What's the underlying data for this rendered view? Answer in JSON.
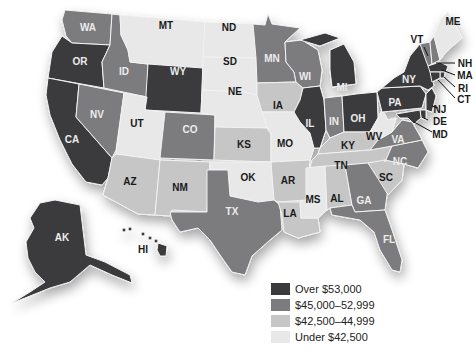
{
  "chart_data": {
    "type": "choropleth",
    "title": "",
    "region": "United States",
    "legend": [
      {
        "key": "c1",
        "label": "Over $53,000",
        "color": "#3b3b3d"
      },
      {
        "key": "c2",
        "label": "$45,000–52,999",
        "color": "#7c7b7e"
      },
      {
        "key": "c3",
        "label": "$42,500–44,999",
        "color": "#c6c6c7"
      },
      {
        "key": "c4",
        "label": "Under $42,500",
        "color": "#e8e8e8"
      }
    ],
    "states": {
      "WA": "c2",
      "OR": "c1",
      "CA": "c1",
      "ID": "c2",
      "NV": "c2",
      "MT": "c4",
      "WY": "c1",
      "UT": "c4",
      "CO": "c2",
      "AZ": "c3",
      "NM": "c3",
      "ND": "c4",
      "SD": "c4",
      "NE": "c4",
      "KS": "c3",
      "OK": "c4",
      "TX": "c2",
      "MN": "c2",
      "IA": "c3",
      "MO": "c4",
      "AR": "c3",
      "LA": "c3",
      "WI": "c2",
      "IL": "c1",
      "MI": "c1",
      "IN": "c2",
      "OH": "c1",
      "KY": "c3",
      "TN": "c3",
      "MS": "c4",
      "AL": "c3",
      "GA": "c2",
      "FL": "c2",
      "SC": "c3",
      "NC": "c2",
      "VA": "c2",
      "WV": "c4",
      "PA": "c1",
      "NY": "c1",
      "VT": "c2",
      "NH": "c2",
      "ME": "c4",
      "MA": "c1",
      "RI": "c1",
      "CT": "c1",
      "NJ": "c1",
      "DE": "c1",
      "MD": "c1",
      "AK": "c1",
      "HI": "c1"
    }
  },
  "labels": {
    "WA": "WA",
    "OR": "OR",
    "CA": "CA",
    "ID": "ID",
    "NV": "NV",
    "MT": "MT",
    "WY": "WY",
    "UT": "UT",
    "CO": "CO",
    "AZ": "AZ",
    "NM": "NM",
    "ND": "ND",
    "SD": "SD",
    "NE": "NE",
    "KS": "KS",
    "OK": "OK",
    "TX": "TX",
    "MN": "MN",
    "IA": "IA",
    "MO": "MO",
    "AR": "AR",
    "LA": "LA",
    "WI": "WI",
    "IL": "IL",
    "MI": "MI",
    "IN": "IN",
    "OH": "OH",
    "KY": "KY",
    "TN": "TN",
    "MS": "MS",
    "AL": "AL",
    "GA": "GA",
    "FL": "FL",
    "SC": "SC",
    "NC": "NC",
    "VA": "VA",
    "WV": "WV",
    "PA": "PA",
    "NY": "NY",
    "VT": "VT",
    "NH": "NH",
    "ME": "ME",
    "MA": "MA",
    "RI": "RI",
    "CT": "CT",
    "NJ": "NJ",
    "DE": "DE",
    "MD": "MD",
    "AK": "AK",
    "HI": "HI"
  },
  "legend": {
    "items": [
      {
        "label": "Over $53,000"
      },
      {
        "label": "$45,000–52,999"
      },
      {
        "label": "$42,500–44,999"
      },
      {
        "label": "Under $42,500"
      }
    ]
  }
}
